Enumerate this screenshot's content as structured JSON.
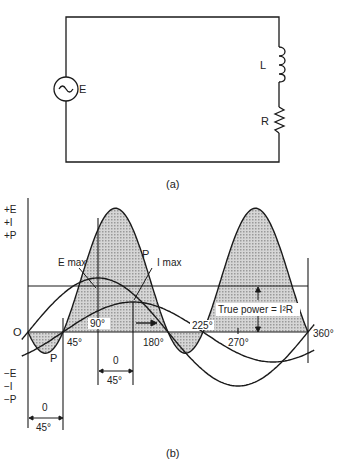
{
  "figure_a": {
    "caption": "(a)",
    "source_label": "E",
    "inductor_label": "L",
    "resistor_label": "R"
  },
  "figure_b": {
    "caption": "(b)",
    "y_axis_positive": [
      "+E",
      "+I",
      "+P"
    ],
    "y_axis_negative": [
      "−E",
      "−I",
      "−P"
    ],
    "origin_label": "O",
    "angle_labels": [
      "45°",
      "90°",
      "180°",
      "225°",
      "270°",
      "360°"
    ],
    "curve_labels": {
      "e_max": "E max",
      "i_max": "I max",
      "power_top": "P",
      "power_bottom": "P"
    },
    "true_power_label": "True power = I²R",
    "phase_shift_dims": [
      {
        "top": "0",
        "bottom": "45°"
      },
      {
        "top": "0",
        "bottom": "45°"
      }
    ]
  },
  "colors": {
    "line": "#1a1a1a",
    "shade": "#b8b8b8"
  }
}
